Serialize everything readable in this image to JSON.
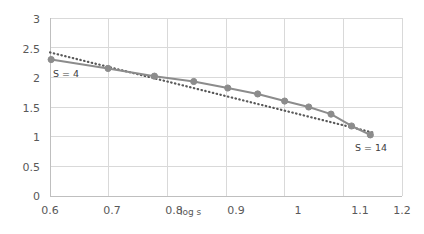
{
  "chart_data": {
    "type": "line",
    "title": "",
    "subtitle": "",
    "xlabel": "log s",
    "ylabel": "",
    "xlim": [
      0.6,
      1.2
    ],
    "ylim": [
      0,
      3
    ],
    "grid": true,
    "legend_position": "none",
    "xticks": [
      "0.6",
      "0.7",
      "0.8",
      "0.9",
      "1",
      "1.1",
      "1.2"
    ],
    "xtick_values": [
      0.6,
      0.7,
      0.8,
      0.9,
      1.0,
      1.1,
      1.2
    ],
    "yticks": [
      "0",
      "0.5",
      "1",
      "1.5",
      "2",
      "2.5",
      "3"
    ],
    "ytick_values": [
      0,
      0.5,
      1,
      1.5,
      2,
      2.5,
      3
    ],
    "annotations": [
      {
        "text": "S = 4",
        "x": 0.63,
        "y": 2.06
      },
      {
        "text": "S = 14",
        "x": 1.12,
        "y": 0.84
      }
    ],
    "series": [
      {
        "name": "data",
        "style": "solid-with-markers",
        "color": "#8C8C8C",
        "x": [
          0.602,
          0.699,
          0.778,
          0.845,
          0.903,
          0.954,
          1.0,
          1.041,
          1.079,
          1.114,
          1.146
        ],
        "y": [
          2.3,
          2.15,
          2.02,
          1.93,
          1.82,
          1.72,
          1.6,
          1.5,
          1.38,
          1.18,
          1.03
        ]
      },
      {
        "name": "trendline",
        "style": "dotted",
        "color": "#595959",
        "x": [
          0.6,
          1.15
        ],
        "y": [
          2.42,
          1.07
        ]
      }
    ]
  }
}
